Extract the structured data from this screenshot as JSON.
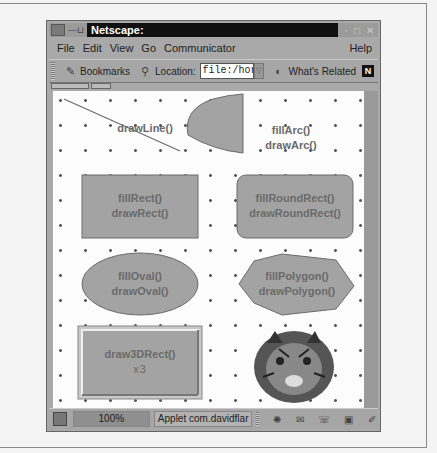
{
  "window": {
    "title": "Netscape:",
    "controls": [
      "minimize",
      "maximize",
      "close"
    ]
  },
  "menubar": {
    "items": [
      "File",
      "Edit",
      "View",
      "Go",
      "Communicator"
    ],
    "help": "Help"
  },
  "toolbar": {
    "bookmarks_label": "Bookmarks",
    "location_label": "Location:",
    "location_value": "file:/hor",
    "whats_related_label": "What's Related",
    "logo": "N"
  },
  "applet": {
    "shapes": [
      {
        "id": "line",
        "labels": [
          "drawLine()"
        ]
      },
      {
        "id": "arc",
        "labels": [
          "fillArc()",
          "drawArc()"
        ]
      },
      {
        "id": "rect",
        "labels": [
          "fillRect()",
          "drawRect()"
        ]
      },
      {
        "id": "roundrect",
        "labels": [
          "fillRoundRect()",
          "drawRoundRect()"
        ]
      },
      {
        "id": "oval",
        "labels": [
          "fillOval()",
          "drawOval()"
        ]
      },
      {
        "id": "polygon",
        "labels": [
          "fillPolygon()",
          "drawPolygon()"
        ]
      },
      {
        "id": "3drect",
        "labels": [
          "draw3DRect()",
          "x3"
        ]
      },
      {
        "id": "image",
        "labels": [
          "tiger image"
        ]
      }
    ],
    "fill_color": "#a3a3a3",
    "stroke_color": "#6b6b6b",
    "text_color": "#6a6a6a"
  },
  "statusbar": {
    "zoom": "100%",
    "message": "Applet com.davidflar",
    "icons": [
      "component-icon",
      "mail-icon",
      "discussion-icon",
      "composer-icon",
      "edit-icon"
    ]
  }
}
